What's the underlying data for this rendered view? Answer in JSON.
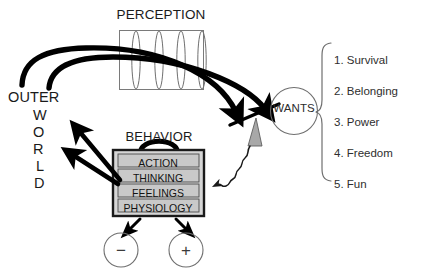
{
  "diagram": {
    "title_perception": "PERCEPTION",
    "title_behavior": "BEHAVIOR",
    "wants_node": "WANTS",
    "outer_world": {
      "line1": "OUTER",
      "vertical_letters": [
        "W",
        "O",
        "R",
        "L",
        "D"
      ]
    },
    "behavior_rows": [
      {
        "label": "ACTION"
      },
      {
        "label": "THINKING"
      },
      {
        "label": "FEELINGS"
      },
      {
        "label": "PHYSIOLOGY"
      }
    ],
    "needs": [
      "1. Survival",
      "2. Belonging",
      "3. Power",
      "4. Freedom",
      "5. Fun"
    ],
    "valence": {
      "negative": "−",
      "positive": "+"
    },
    "colors": {
      "stroke": "#000000",
      "row_fill": "#c9c9c9",
      "box_frame_fill": "#d6d6d6",
      "thin_stroke": "#6f6f6f",
      "triangle_fill": "#a8a8a8",
      "background": "#ffffff"
    },
    "icons": {
      "lens": "lens-ellipse-icon",
      "fulcrum": "triangle-fulcrum-icon",
      "squiggle": "wavy-arrow-icon",
      "brace": "curly-brace-icon"
    }
  }
}
